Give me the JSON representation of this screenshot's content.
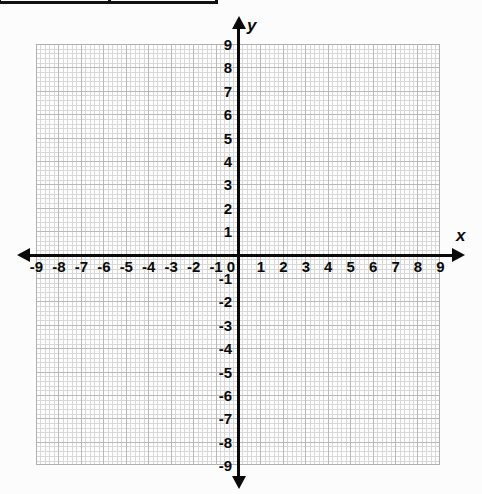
{
  "table_fragment": {
    "cells": [
      "",
      ""
    ]
  },
  "chart_data": {
    "type": "scatter",
    "title": "",
    "xlabel": "x",
    "ylabel": "y",
    "xlim": [
      -9,
      9
    ],
    "ylim": [
      -9,
      9
    ],
    "grid": true,
    "minor_grid": true,
    "minor_ticks_per_cell": 5,
    "legend": "none",
    "series": [],
    "x_tick_labels": [
      "-9",
      "-8",
      "-7",
      "-6",
      "-5",
      "-4",
      "-3",
      "-2",
      "-1",
      "1",
      "2",
      "3",
      "4",
      "5",
      "6",
      "7",
      "8",
      "9"
    ],
    "y_tick_labels": [
      "9",
      "8",
      "7",
      "6",
      "5",
      "4",
      "3",
      "2",
      "1",
      "-1",
      "-2",
      "-3",
      "-4",
      "-5",
      "-6",
      "-7",
      "-8",
      "-9"
    ],
    "origin_label": "0",
    "axis_arrows": [
      "left",
      "right",
      "up",
      "down"
    ],
    "colors": {
      "axis": "#0a0a0a",
      "major_grid": "#b9b9b9",
      "minor_grid": "#d8d8d8",
      "background": "#fcfcfc",
      "plot_background": "#fdfdfd",
      "table_border": "#111111"
    }
  },
  "axis_labels": {
    "x": "x",
    "y": "y"
  }
}
